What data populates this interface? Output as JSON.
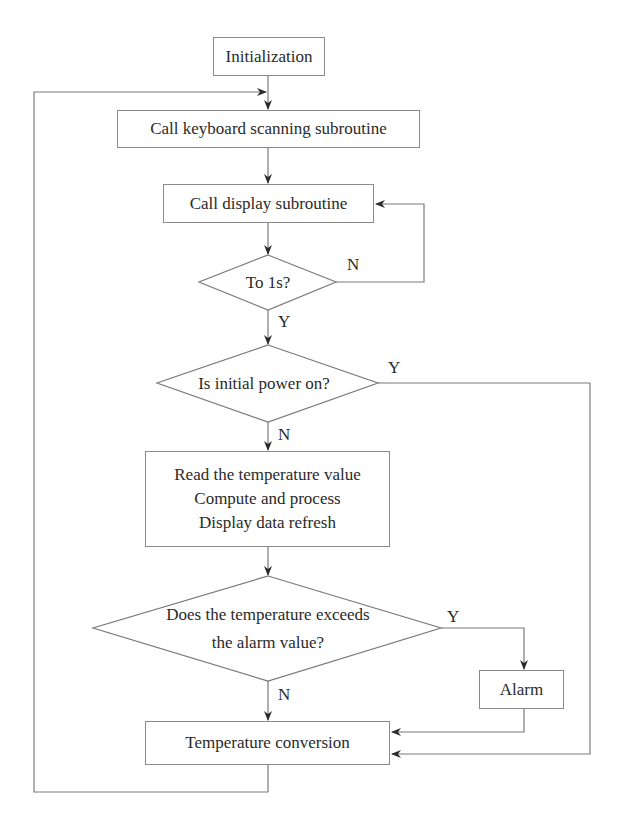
{
  "flowchart": {
    "nodes": {
      "init": {
        "label": "Initialization"
      },
      "keyboard": {
        "label": "Call keyboard scanning subroutine"
      },
      "display": {
        "label": "Call display subroutine"
      },
      "to1s": {
        "label": "To 1s?"
      },
      "power": {
        "label": "Is initial power on?"
      },
      "process": {
        "lines": [
          "Read the temperature value",
          "Compute and process",
          "Display data refresh"
        ]
      },
      "exceeds": {
        "lines": [
          "Does the temperature exceeds",
          "the alarm value?"
        ]
      },
      "alarm": {
        "label": "Alarm"
      },
      "conversion": {
        "label": "Temperature conversion"
      }
    },
    "edge_labels": {
      "to1s_no": "N",
      "to1s_yes": "Y",
      "power_yes": "Y",
      "power_no": "N",
      "exceeds_yes": "Y",
      "exceeds_no": "N"
    },
    "colors": {
      "line": "#7a7a7a",
      "arrow": "#2b2b2b",
      "text": "#2a2a2a",
      "background": "#ffffff"
    }
  }
}
